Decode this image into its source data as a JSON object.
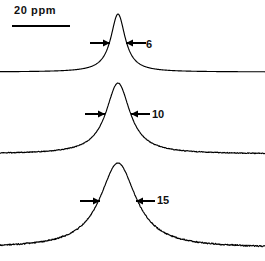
{
  "figure": {
    "background_color": "#ffffff",
    "trace_color": "#000000",
    "scale_bar": {
      "label": "20 ppm",
      "value": 20,
      "unit": "ppm",
      "x_start_px": 12,
      "x_end_px": 70,
      "y_px": 26
    }
  },
  "chart_data": {
    "type": "line",
    "title": "",
    "subtitle": "",
    "xlabel": "",
    "ylabel": "",
    "grid": false,
    "legend_position": "none",
    "axis_visible": false,
    "x_unit": "ppm",
    "x_scale_reference": {
      "label": "20 ppm",
      "pixels": 58,
      "ppm": 20
    },
    "annotations": [
      {
        "text": "6",
        "kind": "linewidth-label",
        "series": "spectrum-1"
      },
      {
        "text": "10",
        "kind": "linewidth-label",
        "series": "spectrum-2"
      },
      {
        "text": "15",
        "kind": "linewidth-label",
        "series": "spectrum-3"
      }
    ],
    "series": [
      {
        "name": "spectrum-1",
        "linewidth_label": "6",
        "linewidth_ppm": 6,
        "noise": 0.0,
        "peak_center_px": 118,
        "baseline_px": 72,
        "apex_px": 14,
        "amplitude_px": 58,
        "hwhm_px": 8.7,
        "arrow_y_px": 43,
        "arrow_left_x_px": 90,
        "arrow_right_x_px": 146,
        "arrow_left_tip_px": 110,
        "arrow_right_tip_px": 126
      },
      {
        "name": "spectrum-2",
        "linewidth_label": "10",
        "linewidth_ppm": 10,
        "noise": 0.55,
        "peak_center_px": 118,
        "baseline_px": 154,
        "apex_px": 83,
        "amplitude_px": 71,
        "hwhm_px": 14.5,
        "arrow_y_px": 114,
        "arrow_left_x_px": 85,
        "arrow_right_x_px": 150,
        "arrow_left_tip_px": 105,
        "arrow_right_tip_px": 131
      },
      {
        "name": "spectrum-3",
        "linewidth_label": "15",
        "linewidth_ppm": 15,
        "noise": 0.9,
        "peak_center_px": 118,
        "baseline_px": 248,
        "apex_px": 163,
        "amplitude_px": 85,
        "hwhm_px": 21.8,
        "arrow_y_px": 201,
        "arrow_left_x_px": 80,
        "arrow_right_x_px": 155,
        "arrow_left_tip_px": 100,
        "arrow_right_tip_px": 136
      }
    ]
  }
}
